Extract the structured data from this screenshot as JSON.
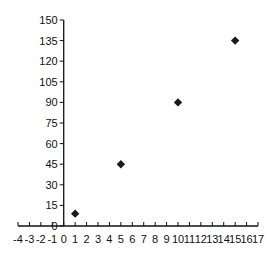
{
  "chart_data": {
    "type": "scatter",
    "title": "",
    "xlabel": "",
    "ylabel": "",
    "xlim": [
      -4,
      17
    ],
    "ylim": [
      0,
      150
    ],
    "grid": false,
    "legend": null,
    "marker": "diamond",
    "marker_color": "#1a1a1a",
    "x_ticks": [
      -4,
      -3,
      -2,
      -1,
      0,
      1,
      2,
      3,
      4,
      5,
      6,
      7,
      8,
      9,
      10,
      11,
      12,
      13,
      14,
      15,
      16,
      17
    ],
    "y_ticks": [
      0,
      15,
      30,
      45,
      60,
      75,
      90,
      105,
      120,
      135,
      150
    ],
    "series": [
      {
        "name": "Series 1",
        "x": [
          1,
          5,
          10,
          15
        ],
        "y": [
          9,
          45,
          90,
          135
        ]
      }
    ]
  }
}
